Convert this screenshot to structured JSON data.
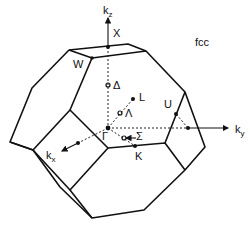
{
  "title": "fcc",
  "axes": {
    "kz": {
      "base": "k",
      "sub": "z"
    },
    "ky": {
      "base": "k",
      "sub": "y"
    },
    "kx": {
      "base": "k",
      "sub": "x"
    }
  },
  "points": {
    "gamma": "Γ",
    "X": "X",
    "W": "W",
    "L": "L",
    "U": "U",
    "K": "K",
    "delta": "Δ",
    "lambda": "Λ",
    "sigma": "Σ"
  },
  "colors": {
    "line": "#111111",
    "background": "#ffffff"
  }
}
